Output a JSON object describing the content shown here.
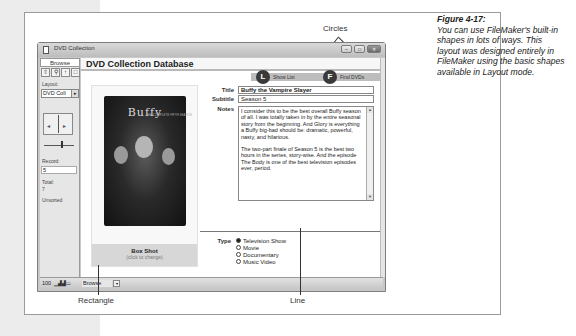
{
  "window": {
    "title": "DVD Collection",
    "buttons": {
      "minimize": "–",
      "maximize": "□",
      "close": "✕"
    }
  },
  "status_area": {
    "mode_tab": "Browse",
    "tools": [
      "browse-tool",
      "find-tool",
      "layout-tool",
      "preview-tool"
    ],
    "tool_glyphs": [
      "⇧",
      "⚲",
      "↑",
      "□"
    ],
    "layout_label": "Layout:",
    "layout_value": "DVD Coll",
    "record_label": "Record:",
    "record_value": "5",
    "total_label": "Total:",
    "total_value": "7",
    "sort_state": "Unsorted"
  },
  "layout": {
    "db_title": "DVD Collection Database",
    "actions": [
      {
        "icon_letter": "L",
        "label": "Show List"
      },
      {
        "icon_letter": "F",
        "label": "Find DVDs"
      }
    ],
    "photo": {
      "logo": "Buffy",
      "cover_caption": "THE COMPLETE FIFTH SEASON",
      "label": "Box Shot",
      "hint": "(click to change)"
    },
    "fields": {
      "title_label": "Title",
      "title_value": "Buffy the Vampire Slayer",
      "subtitle_label": "Subtitle",
      "subtitle_value": "Season 5",
      "notes_label": "Notes",
      "notes_p1": "I consider this to be the best overall Buffy season of all. I was totally taken in by the entire seasonal story from the beginning. And Glory is everything a Buffy big-bad should be: dramatic, powerful, nasty, and hilarious.",
      "notes_p2": "The two-part finale of Season 5 is the best two hours in the series, story-wise. And the episode The Body is one of the best television episodes ever, period."
    },
    "type": {
      "label": "Type",
      "options": [
        "Television Show",
        "Movie",
        "Documentary",
        "Music Video"
      ],
      "selected": "Television Show"
    }
  },
  "bottom_bar": {
    "zoom": "100",
    "mode": "Browse",
    "arrow": "▾"
  },
  "callouts": {
    "circles": "Circles",
    "rectangle": "Rectangle",
    "line": "Line"
  },
  "figure_caption": {
    "number": "Figure 4-17:",
    "text": "You can use FileMaker's built-in shapes in lots of ways. This layout was designed entirely in FileMaker using the basic shapes available in Layout mode."
  }
}
